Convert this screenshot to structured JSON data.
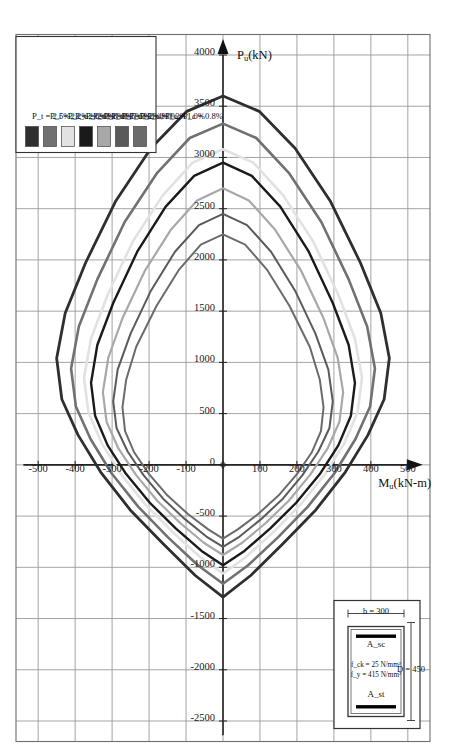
{
  "figure": {
    "type": "interaction-diagram",
    "axis_x_label": "M_u(kN-m)",
    "axis_y_label": "P_u(kN)"
  },
  "inset": {
    "title": "column-cross-section",
    "depth_label": "D = 450",
    "width_label": "b = 300",
    "fck_label": "f_ck = 25 N/mm²",
    "fy_label": "f_y = 415 N/mm²",
    "asc_label": "A_sc",
    "ast_label": "A_st"
  },
  "legend": {
    "items": [
      {
        "label": "P_t = 1.0%; P_c = 0.8%",
        "color": "#6b6b6b"
      },
      {
        "label": "P_t = 1.2%; P_c = 1.0%",
        "color": "#5a5a5a"
      },
      {
        "label": "P_t = 1.5%; P_c = 1.2%",
        "color": "#a8a8a8"
      },
      {
        "label": "P_t = 1.8%; P_c = 1.4%",
        "color": "#1a1a1a"
      },
      {
        "label": "P_t = 2.0%; P_c = 1.5%",
        "color": "#e2e2e2"
      },
      {
        "label": "P_t = 2.2%; P_c = 1.8%",
        "color": "#717171"
      },
      {
        "label": "P_t = 2.5%; P_c = 2.0%",
        "color": "#2f2f2f"
      }
    ]
  },
  "chart_data": {
    "type": "line",
    "title": "",
    "xlabel": "M_u(kN-m)",
    "ylabel": "P_u(kN)",
    "xlim": [
      -560,
      560
    ],
    "ylim": [
      -2700,
      4200
    ],
    "grid": true,
    "legend_position": "bottom-left",
    "x_ticks": [
      -500,
      -400,
      -300,
      -200,
      -100,
      0,
      100,
      200,
      300,
      400,
      500
    ],
    "y_ticks": [
      -2500,
      -2000,
      -1500,
      -1000,
      -500,
      0,
      500,
      1000,
      1500,
      2000,
      2500,
      3000,
      3500,
      4000
    ],
    "x_tick_labels": [
      "-500",
      "-400",
      "-300",
      "-200",
      "-100",
      "0",
      "100",
      "200",
      "300",
      "400",
      "500"
    ],
    "y_tick_labels": [
      "-2500",
      "-2000",
      "-1500",
      "-1000",
      "-500",
      "0",
      "500",
      "1000",
      "1500",
      "2000",
      "2500",
      "3000",
      "3500",
      "4000"
    ],
    "series": [
      {
        "name": "P_t = 1.0%; P_c = 0.8%",
        "color": "#6b6b6b",
        "width": 2.0,
        "points": [
          [
            0,
            2250
          ],
          [
            60,
            2150
          ],
          [
            120,
            1900
          ],
          [
            180,
            1550
          ],
          [
            235,
            1150
          ],
          [
            262,
            830
          ],
          [
            272,
            560
          ],
          [
            265,
            330
          ],
          [
            240,
            120
          ],
          [
            200,
            -90
          ],
          [
            150,
            -300
          ],
          [
            95,
            -480
          ],
          [
            40,
            -630
          ],
          [
            0,
            -720
          ],
          [
            -40,
            -630
          ],
          [
            -95,
            -480
          ],
          [
            -150,
            -300
          ],
          [
            -200,
            -90
          ],
          [
            -240,
            120
          ],
          [
            -265,
            330
          ],
          [
            -272,
            560
          ],
          [
            -262,
            830
          ],
          [
            -235,
            1150
          ],
          [
            -180,
            1550
          ],
          [
            -120,
            1900
          ],
          [
            -60,
            2150
          ],
          [
            0,
            2250
          ]
        ]
      },
      {
        "name": "P_t = 1.2%; P_c = 1.0%",
        "color": "#5a5a5a",
        "width": 2.0,
        "points": [
          [
            0,
            2450
          ],
          [
            65,
            2340
          ],
          [
            130,
            2080
          ],
          [
            195,
            1700
          ],
          [
            250,
            1280
          ],
          [
            285,
            930
          ],
          [
            297,
            620
          ],
          [
            288,
            360
          ],
          [
            258,
            130
          ],
          [
            215,
            -100
          ],
          [
            162,
            -330
          ],
          [
            103,
            -530
          ],
          [
            45,
            -700
          ],
          [
            0,
            -800
          ],
          [
            -45,
            -700
          ],
          [
            -103,
            -530
          ],
          [
            -162,
            -330
          ],
          [
            -215,
            -100
          ],
          [
            -258,
            130
          ],
          [
            -288,
            360
          ],
          [
            -297,
            620
          ],
          [
            -285,
            930
          ],
          [
            -250,
            1280
          ],
          [
            -195,
            1700
          ],
          [
            -130,
            2080
          ],
          [
            -65,
            2340
          ],
          [
            0,
            2450
          ]
        ]
      },
      {
        "name": "P_t = 1.5%; P_c = 1.2%",
        "color": "#a8a8a8",
        "width": 2.2,
        "points": [
          [
            0,
            2700
          ],
          [
            70,
            2580
          ],
          [
            140,
            2300
          ],
          [
            212,
            1890
          ],
          [
            272,
            1430
          ],
          [
            310,
            1050
          ],
          [
            325,
            710
          ],
          [
            315,
            420
          ],
          [
            283,
            160
          ],
          [
            236,
            -95
          ],
          [
            178,
            -350
          ],
          [
            115,
            -570
          ],
          [
            52,
            -760
          ],
          [
            0,
            -880
          ],
          [
            -52,
            -760
          ],
          [
            -115,
            -570
          ],
          [
            -178,
            -350
          ],
          [
            -236,
            -95
          ],
          [
            -283,
            160
          ],
          [
            -315,
            420
          ],
          [
            -325,
            710
          ],
          [
            -310,
            1050
          ],
          [
            -272,
            1430
          ],
          [
            -212,
            1890
          ],
          [
            -140,
            2300
          ],
          [
            -70,
            2580
          ],
          [
            0,
            2700
          ]
        ]
      },
      {
        "name": "P_t = 1.8%; P_c = 1.4%",
        "color": "#1a1a1a",
        "width": 2.4,
        "points": [
          [
            0,
            2950
          ],
          [
            78,
            2820
          ],
          [
            155,
            2520
          ],
          [
            232,
            2080
          ],
          [
            297,
            1580
          ],
          [
            340,
            1170
          ],
          [
            357,
            800
          ],
          [
            346,
            480
          ],
          [
            312,
            190
          ],
          [
            262,
            -90
          ],
          [
            198,
            -370
          ],
          [
            128,
            -620
          ],
          [
            58,
            -840
          ],
          [
            0,
            -980
          ],
          [
            -58,
            -840
          ],
          [
            -128,
            -620
          ],
          [
            -198,
            -370
          ],
          [
            -262,
            -90
          ],
          [
            -312,
            190
          ],
          [
            -346,
            480
          ],
          [
            -357,
            800
          ],
          [
            -340,
            1170
          ],
          [
            -297,
            1580
          ],
          [
            -232,
            2080
          ],
          [
            -155,
            2520
          ],
          [
            -78,
            2820
          ],
          [
            0,
            2950
          ]
        ]
      },
      {
        "name": "P_t = 2.0%; P_c = 1.5%",
        "color": "#e2e2e2",
        "width": 2.6,
        "points": [
          [
            0,
            3080
          ],
          [
            82,
            2950
          ],
          [
            163,
            2630
          ],
          [
            244,
            2180
          ],
          [
            312,
            1660
          ],
          [
            357,
            1230
          ],
          [
            376,
            850
          ],
          [
            364,
            510
          ],
          [
            328,
            210
          ],
          [
            276,
            -90
          ],
          [
            209,
            -390
          ],
          [
            135,
            -660
          ],
          [
            62,
            -900
          ],
          [
            0,
            -1060
          ],
          [
            -62,
            -900
          ],
          [
            -135,
            -660
          ],
          [
            -209,
            -390
          ],
          [
            -276,
            -90
          ],
          [
            -328,
            210
          ],
          [
            -364,
            510
          ],
          [
            -376,
            850
          ],
          [
            -357,
            1230
          ],
          [
            -312,
            1660
          ],
          [
            -244,
            2180
          ],
          [
            -163,
            2630
          ],
          [
            -82,
            2950
          ],
          [
            0,
            3080
          ]
        ]
      },
      {
        "name": "P_t = 2.2%; P_c = 1.8%",
        "color": "#717171",
        "width": 2.6,
        "points": [
          [
            0,
            3330
          ],
          [
            90,
            3190
          ],
          [
            178,
            2850
          ],
          [
            266,
            2370
          ],
          [
            340,
            1810
          ],
          [
            390,
            1350
          ],
          [
            411,
            940
          ],
          [
            398,
            570
          ],
          [
            358,
            250
          ],
          [
            302,
            -80
          ],
          [
            229,
            -410
          ],
          [
            148,
            -710
          ],
          [
            68,
            -980
          ],
          [
            0,
            -1160
          ],
          [
            -68,
            -980
          ],
          [
            -148,
            -710
          ],
          [
            -229,
            -410
          ],
          [
            -302,
            -80
          ],
          [
            -358,
            250
          ],
          [
            -398,
            570
          ],
          [
            -411,
            940
          ],
          [
            -390,
            1350
          ],
          [
            -340,
            1810
          ],
          [
            -266,
            2370
          ],
          [
            -178,
            2850
          ],
          [
            -90,
            3190
          ],
          [
            0,
            3330
          ]
        ]
      },
      {
        "name": "P_t = 2.5%; P_c = 2.0%",
        "color": "#2f2f2f",
        "width": 2.8,
        "points": [
          [
            0,
            3600
          ],
          [
            98,
            3450
          ],
          [
            195,
            3090
          ],
          [
            291,
            2570
          ],
          [
            372,
            1970
          ],
          [
            427,
            1480
          ],
          [
            450,
            1040
          ],
          [
            436,
            640
          ],
          [
            392,
            290
          ],
          [
            331,
            -70
          ],
          [
            251,
            -440
          ],
          [
            162,
            -770
          ],
          [
            75,
            -1080
          ],
          [
            0,
            -1290
          ],
          [
            -75,
            -1080
          ],
          [
            -162,
            -770
          ],
          [
            -251,
            -440
          ],
          [
            -331,
            -70
          ],
          [
            -392,
            290
          ],
          [
            -436,
            640
          ],
          [
            -450,
            1040
          ],
          [
            -427,
            1480
          ],
          [
            -372,
            1970
          ],
          [
            -291,
            2570
          ],
          [
            -195,
            3090
          ],
          [
            -98,
            3450
          ],
          [
            0,
            3600
          ]
        ]
      }
    ]
  }
}
